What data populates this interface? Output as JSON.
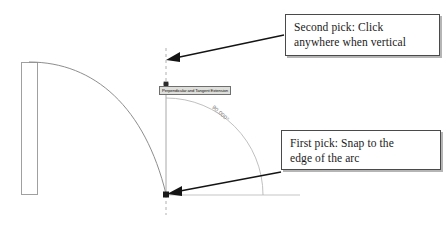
{
  "drawing": {
    "title": "CAD arc perpendicular snap illustration",
    "colors": {
      "geometry_line": "#9a9a9a",
      "construction_line": "#a8a8a8",
      "dashed_line": "#b4b4b4",
      "arrow": "#1c1c1c",
      "callout_border": "#4a4a4a",
      "callout_background": "#ffffff",
      "tooltip_background": "#dededa",
      "tooltip_border": "#6f6f6f",
      "angle_text": "#6d6d6d",
      "page_background": "#ffffff"
    },
    "shapes": {
      "wall_rectangle": "vertical-rectangle-left",
      "arc": "quarter-arc-sweeping-right-down",
      "construction_line": "vertical-line",
      "dashed_extension": "vertical-dashed-extension",
      "angle_arc": "quarter-angle-indicator"
    }
  },
  "angle": {
    "value": "90.000°"
  },
  "tooltip": {
    "label": "Perpendicular and Tangent Extension"
  },
  "callouts": {
    "second_pick": {
      "line1": "Second pick: Click",
      "line2": "anywhere when vertical"
    },
    "first_pick": {
      "line1": "First pick: Snap to the",
      "line2": "edge of the arc"
    }
  },
  "markers": {
    "second_pick_point": "top-snap-point",
    "first_pick_point": "bottom-snap-point"
  }
}
